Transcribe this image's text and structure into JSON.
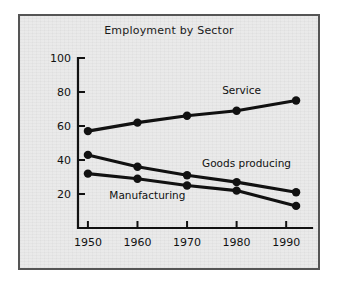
{
  "figure": {
    "background_color": "#e9e9e9",
    "border_color": "#555555",
    "ink_color": "#111111"
  },
  "chart_data": {
    "type": "line",
    "title": "Employment by Sector",
    "xlabel": "",
    "ylabel": "",
    "xlim": [
      1948,
      1994
    ],
    "ylim": [
      0,
      100
    ],
    "grid": false,
    "legend_position": "inline-annotations",
    "x": [
      1950,
      1960,
      1970,
      1980,
      1992
    ],
    "xtick_labels": [
      "1950",
      "1960",
      "1970",
      "1980",
      "1990"
    ],
    "xticks": [
      1950,
      1960,
      1970,
      1980,
      1990
    ],
    "ytick_labels": [
      "20",
      "40",
      "60",
      "80",
      "100"
    ],
    "yticks": [
      20,
      40,
      60,
      80,
      100
    ],
    "series": [
      {
        "name": "Service",
        "label": "Service",
        "values": [
          57,
          62,
          66,
          69,
          75
        ],
        "label_x": 1981,
        "label_y": 79
      },
      {
        "name": "Goods producing",
        "label": "Goods producing",
        "values": [
          43,
          36,
          31,
          27,
          21
        ],
        "label_x": 1982,
        "label_y": 36
      },
      {
        "name": "Manufacturing",
        "label": "Manufacturing",
        "values": [
          32,
          29,
          25,
          22,
          13
        ],
        "label_x": 1962,
        "label_y": 17
      }
    ]
  }
}
